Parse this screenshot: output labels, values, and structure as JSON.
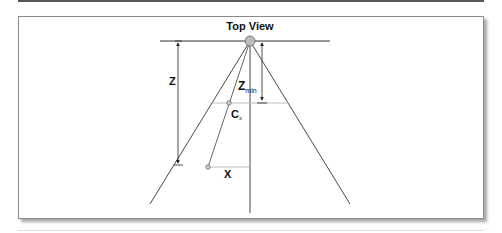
{
  "figure": {
    "title": "Top View",
    "labels": {
      "z": "Z",
      "zmin_main": "Z",
      "zmin_sub": "min",
      "cx_main": "C",
      "cx_sub": "x",
      "x": "X"
    },
    "colors": {
      "line": "#333333",
      "light_line": "#bbbbbb",
      "camera_fill": "#bdbdbd",
      "point_fill": "#d0d0d0",
      "frame": "#8a8a8a"
    }
  }
}
